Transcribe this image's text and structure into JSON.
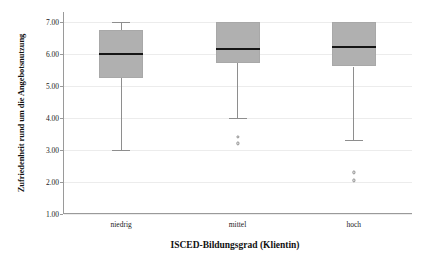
{
  "chart_data": {
    "type": "box",
    "title": "",
    "xlabel": "ISCED-Bildungsgrad (Klientin)",
    "ylabel": "Zufriedenheit rund um die Angebotsnutzung",
    "ylim": [
      1.0,
      7.3
    ],
    "yticks": [
      1.0,
      2.0,
      3.0,
      4.0,
      5.0,
      6.0,
      7.0
    ],
    "ytick_labels": [
      "1.00",
      "2.00",
      "3.00",
      "4.00",
      "5.00",
      "6.00",
      "7.00"
    ],
    "grid": true,
    "legend": "none",
    "categories": [
      "niedrig",
      "mittel",
      "hoch"
    ],
    "box_color": "#b0b0b0",
    "median_color": "#151515",
    "whisker_color": "#8e8e8e",
    "gridline_color": "#ececec",
    "axis_color": "#9a9a9a",
    "boxes": [
      {
        "category": "niedrig",
        "whisker_low": 3.0,
        "q1": 5.25,
        "median": 6.0,
        "q3": 6.75,
        "whisker_high": 7.0,
        "outliers": []
      },
      {
        "category": "mittel",
        "whisker_low": 4.0,
        "q1": 5.7,
        "median": 6.15,
        "q3": 7.0,
        "whisker_high": 7.0,
        "outliers": [
          3.4,
          3.2
        ]
      },
      {
        "category": "hoch",
        "whisker_low": 3.3,
        "q1": 5.6,
        "median": 6.2,
        "q3": 7.0,
        "whisker_high": 7.0,
        "outliers": [
          2.3,
          2.05
        ]
      }
    ]
  },
  "axis": {
    "y_title": "Zufriedenheit rund um die Angebotsnutzung",
    "x_title": "ISCED-Bildungsgrad (Klientin)"
  }
}
